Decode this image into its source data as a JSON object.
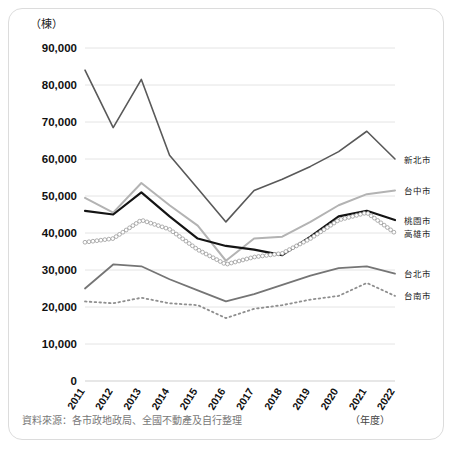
{
  "chart_data": {
    "type": "line",
    "title": "",
    "xlabel": "（年度）",
    "ylabel": "（棟）",
    "unit_top_label": "（棟）",
    "unit_right_label": "（年度）",
    "ylim": [
      0,
      90000
    ],
    "ytick_values": [
      0,
      10000,
      20000,
      30000,
      40000,
      50000,
      60000,
      70000,
      80000,
      90000
    ],
    "ytick_labels": [
      "0",
      "10,000",
      "20,000",
      "30,000",
      "40,000",
      "50,000",
      "60,000",
      "70,000",
      "80,000",
      "90,000"
    ],
    "categories": [
      "2011",
      "2012",
      "2013",
      "2014",
      "2015",
      "2016",
      "2017",
      "2018",
      "2019",
      "2020",
      "2021",
      "2022"
    ],
    "x": [
      2011,
      2012,
      2013,
      2014,
      2015,
      2016,
      2017,
      2018,
      2019,
      2020,
      2021,
      2022
    ],
    "grid": true,
    "legend_position": "right",
    "series": [
      {
        "name": "新北市",
        "color": "#595959",
        "style": "solid",
        "width": 1.6,
        "marker": "none",
        "values": [
          84000,
          68500,
          81500,
          61000,
          52000,
          43000,
          51500,
          54500,
          58000,
          62000,
          67500,
          60000
        ]
      },
      {
        "name": "台中市",
        "color": "#b3b3b3",
        "style": "solid",
        "width": 2.0,
        "marker": "none",
        "values": [
          49500,
          45500,
          53500,
          47500,
          42000,
          32500,
          38500,
          39000,
          43000,
          47500,
          50500,
          51500
        ]
      },
      {
        "name": "桃園市",
        "color": "#141414",
        "style": "solid",
        "width": 2.2,
        "marker": "none",
        "values": [
          46000,
          45000,
          51000,
          44500,
          38500,
          36500,
          35500,
          34000,
          39000,
          44500,
          46000,
          43500
        ]
      },
      {
        "name": "高雄市",
        "color": "#9a9a9a",
        "style": "circles",
        "width": 1.2,
        "marker": "circle",
        "values": [
          37500,
          38500,
          43500,
          41000,
          35500,
          31500,
          33500,
          34500,
          38500,
          43500,
          45500,
          40000
        ]
      },
      {
        "name": "台北市",
        "color": "#757575",
        "style": "solid",
        "width": 1.8,
        "marker": "none",
        "values": [
          25000,
          31500,
          31000,
          27500,
          24500,
          21500,
          23500,
          26000,
          28500,
          30500,
          31000,
          29000
        ]
      },
      {
        "name": "台南市",
        "color": "#8f8f8f",
        "style": "dotted",
        "width": 1.8,
        "marker": "none",
        "values": [
          21500,
          21000,
          22500,
          21000,
          20500,
          17000,
          19500,
          20500,
          22000,
          23000,
          26500,
          23000
        ]
      }
    ],
    "source_note": "資料來源：各市政地政局、全國不動產及自行整理"
  },
  "plot": {
    "left": 85,
    "right": 395,
    "top": 48,
    "bottom": 381
  }
}
